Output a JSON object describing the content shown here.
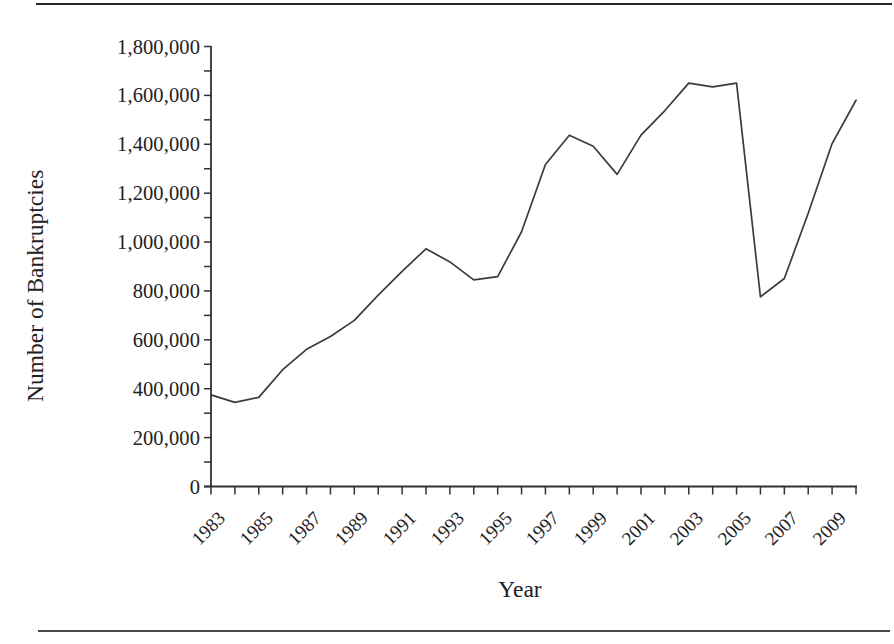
{
  "figure": {
    "top_rule": "horizontal-rule",
    "bottom_rule": "horizontal-rule"
  },
  "axes": {
    "y_title": "Number of Bankruptcies",
    "x_title": "Year",
    "y_tick_labels": [
      "1,800,000",
      "1,600,000",
      "1,400,000",
      "1,200,000",
      "1,000,000",
      "800,000",
      "600,000",
      "400,000",
      "200,000",
      "0"
    ],
    "x_tick_labels": [
      "1983",
      "1985",
      "1987",
      "1989",
      "1991",
      "1993",
      "1995",
      "1997",
      "1999",
      "2001",
      "2003",
      "2005",
      "2007",
      "2009"
    ],
    "line_color": "#3d3a3d",
    "axis_color": "#333033"
  },
  "chart_data": {
    "type": "line",
    "title": "",
    "subtitle": "",
    "xlabel": "Year",
    "ylabel": "Number of Bankruptcies",
    "xlim": [
      1983,
      2010
    ],
    "ylim": [
      0,
      1800000
    ],
    "ytick_values": [
      0,
      200000,
      400000,
      600000,
      800000,
      1000000,
      1200000,
      1400000,
      1600000,
      1800000
    ],
    "xtick_values": [
      1983,
      1985,
      1987,
      1989,
      1991,
      1993,
      1995,
      1997,
      1999,
      2001,
      2003,
      2005,
      2007,
      2009
    ],
    "xtick_minor_every": 1,
    "grid": false,
    "legend": false,
    "legend_position": "none",
    "x": [
      1983,
      1984,
      1985,
      1986,
      1987,
      1988,
      1989,
      1990,
      1991,
      1992,
      1993,
      1994,
      1995,
      1996,
      1997,
      1998,
      1999,
      2000,
      2001,
      2002,
      2003,
      2004,
      2005,
      2006,
      2007,
      2008,
      2009,
      2010
    ],
    "values": [
      374734,
      344275,
      364536,
      477856,
      561278,
      613465,
      679461,
      782960,
      880399,
      972490,
      918734,
      845257,
      858452,
      1042110,
      1317000,
      1436964,
      1392000,
      1277000,
      1437354,
      1538000,
      1650279,
      1635000,
      1650000,
      776000,
      850912,
      1117771,
      1402816,
      1580000
    ],
    "series": [
      {
        "name": "Number of Bankruptcies",
        "values": [
          374734,
          344275,
          364536,
          477856,
          561278,
          613465,
          679461,
          782960,
          880399,
          972490,
          918734,
          845257,
          858452,
          1042110,
          1317000,
          1436964,
          1392000,
          1277000,
          1437354,
          1538000,
          1650279,
          1635000,
          1650000,
          776000,
          850912,
          1117771,
          1402816,
          1580000
        ]
      }
    ]
  }
}
